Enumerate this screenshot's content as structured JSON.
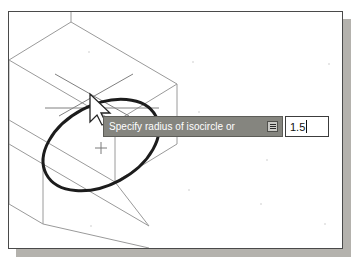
{
  "app": {
    "kind": "cad-drawing-area",
    "background_color": "#ffffff",
    "frame_border_color": "#4a4a4a",
    "frame_shadow_color": "#b4b2ad"
  },
  "drawing": {
    "description": "Isometric rectangular block with an isocircle (isometric ellipse) being drawn on its top face",
    "line_color": "#9a9a9a",
    "ellipse_color": "#1c1c1c",
    "crosshair_color": "#6e6e6e",
    "cursor": "arrow-pointer",
    "center_marker": "small-cross"
  },
  "dynamic_input": {
    "prompt": "Specify radius of isocircle or",
    "prompt_background": "#85857f",
    "prompt_text_color": "#ffffff",
    "expand_button_name": "options-expand",
    "value": "1.5",
    "value_placeholder": "0.0",
    "has_caret": true
  }
}
